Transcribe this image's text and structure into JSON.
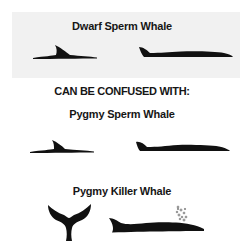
{
  "diagram": {
    "primary_species": {
      "title": "Dwarf Sperm Whale",
      "silhouettes": [
        "dorsal-fin-surfacing",
        "full-back-profile"
      ]
    },
    "comparison_heading": "CAN BE CONFUSED WITH:",
    "similar_species": [
      {
        "title": "Pygmy Sperm Whale",
        "silhouettes": [
          "dorsal-fin-surfacing",
          "full-back-profile"
        ]
      },
      {
        "title": "Pygmy Killer Whale",
        "silhouettes": [
          "tail-flukes",
          "back-profile-with-blow"
        ]
      }
    ],
    "colors": {
      "panel_background": "#f1f1f1",
      "silhouette": "#111111",
      "text": "#161616"
    }
  }
}
